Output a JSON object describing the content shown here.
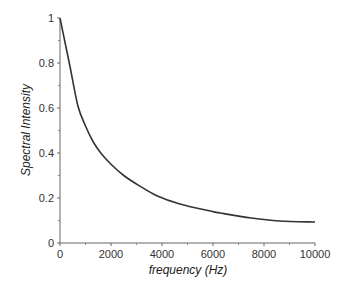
{
  "chart_data": {
    "type": "line",
    "title": "",
    "xlabel": "frequency (Hz)",
    "ylabel": "Spectral Intensity",
    "xlim": [
      0,
      10000
    ],
    "ylim": [
      0,
      1
    ],
    "x_ticks": [
      0,
      2000,
      4000,
      6000,
      8000,
      10000
    ],
    "x_tick_labels": [
      "0",
      "2000",
      "4000",
      "6000",
      "8000",
      "10000"
    ],
    "y_ticks": [
      0,
      0.2,
      0.4,
      0.6,
      0.8,
      1
    ],
    "y_tick_labels": [
      "0",
      "0.2",
      "0.4",
      "0.6",
      "0.8",
      "1"
    ],
    "grid": false,
    "legend": null,
    "series": [
      {
        "name": "spectral intensity",
        "color": "#333333",
        "x": [
          0,
          200,
          400,
          700,
          1000,
          1300,
          1600,
          2000,
          2500,
          3100,
          3800,
          4700,
          5900,
          6300,
          7500,
          8600,
          10000
        ],
        "values": [
          1.0,
          0.89,
          0.78,
          0.61,
          0.52,
          0.45,
          0.4,
          0.35,
          0.3,
          0.255,
          0.21,
          0.173,
          0.142,
          0.133,
          0.111,
          0.098,
          0.093
        ]
      }
    ]
  }
}
